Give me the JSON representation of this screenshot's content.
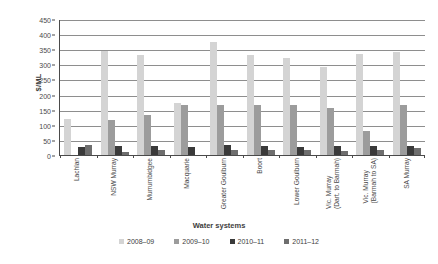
{
  "chart_data": {
    "type": "bar",
    "title": "",
    "xlabel": "Water systems",
    "ylabel": "$/ML",
    "ylim": [
      0,
      450
    ],
    "ytick_step": 50,
    "yticks": [
      0,
      50,
      100,
      150,
      200,
      250,
      300,
      350,
      400,
      450
    ],
    "ytick_labels": [
      "0",
      "50",
      "100",
      "150",
      "200",
      "250",
      "300",
      "350",
      "400",
      "450"
    ],
    "grid": true,
    "legend_position": "bottom",
    "categories": [
      "Lachlan",
      "NSW Murray",
      "Murrumbidgee",
      "Macquarie",
      "Greater Goulburn",
      "Boort",
      "Lower Goulburn",
      "Vic. Murray (Dart. to Barmah)",
      "Vic. Murray (Barmah to SA)",
      "SA Murray"
    ],
    "category_lines": [
      [
        "Lachlan",
        ""
      ],
      [
        "NSW Murray",
        ""
      ],
      [
        "Murrumbidgee",
        ""
      ],
      [
        "Macquarie",
        ""
      ],
      [
        "Greater Goulburn",
        ""
      ],
      [
        "Boort",
        ""
      ],
      [
        "Lower Goulburn",
        ""
      ],
      [
        "Vic. Murray",
        "(Dart. to Barmah)"
      ],
      [
        "Vic. Murray",
        "(Barmah to SA)"
      ],
      [
        "SA Murray",
        ""
      ]
    ],
    "series": [
      {
        "name": "2008–09",
        "color": "#d4d4d4",
        "values": [
          120,
          345,
          330,
          172,
          375,
          330,
          320,
          290,
          335,
          340
        ]
      },
      {
        "name": "2009–10",
        "color": "#9c9c9c",
        "values": [
          0,
          117,
          133,
          167,
          165,
          167,
          165,
          155,
          78,
          165
        ]
      },
      {
        "name": "2010–11",
        "color": "#3a3a3a",
        "values": [
          28,
          29,
          30,
          25,
          32,
          30,
          28,
          30,
          30,
          30
        ]
      },
      {
        "name": "2011–12",
        "color": "#6e6e6e",
        "values": [
          32,
          10,
          18,
          0,
          18,
          18,
          16,
          14,
          18,
          22
        ]
      }
    ]
  }
}
